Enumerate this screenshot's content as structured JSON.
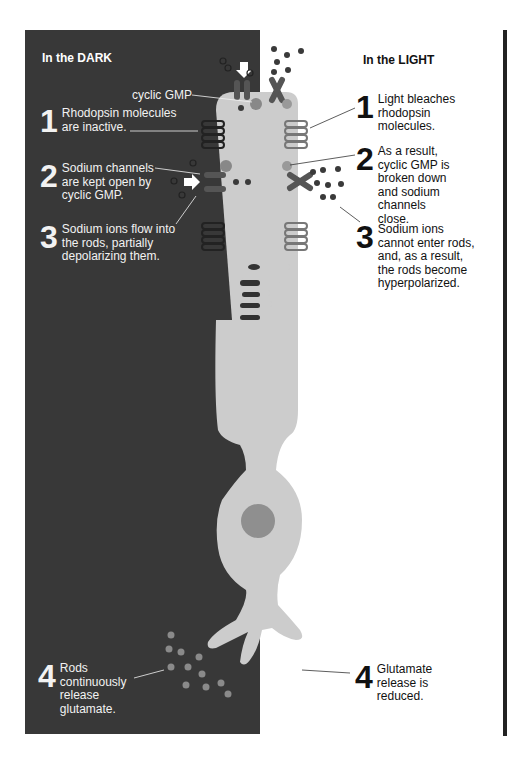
{
  "dark_side": {
    "heading": "In the DARK",
    "cyclic_gmp_label": "cyclic GMP",
    "steps": [
      {
        "number": "1",
        "text": "Rhodopsin molecules are inactive."
      },
      {
        "number": "2",
        "text": "Sodium channels are kept open by cyclic GMP."
      },
      {
        "number": "3",
        "text": "Sodium ions flow into the rods, partially depolarizing them."
      },
      {
        "number": "4",
        "text": "Rods continuously release glutamate."
      }
    ]
  },
  "light_side": {
    "heading": "In the LIGHT",
    "steps": [
      {
        "number": "1",
        "text": "Light bleaches rhodopsin molecules."
      },
      {
        "number": "2",
        "text": "As a result, cyclic GMP is broken down and sodium channels close."
      },
      {
        "number": "3",
        "text": "Sodium ions cannot enter rods, and, as a result, the rods become hyperpolarized."
      },
      {
        "number": "4",
        "text": "Glutamate release is reduced."
      }
    ]
  },
  "colors": {
    "dark_panel": "#383838",
    "rod_cell": "#cccccc",
    "nucleus": "#8f8f8f",
    "glutamate": "#8a8a8a",
    "sodium_ion": "#3a3a3a"
  }
}
